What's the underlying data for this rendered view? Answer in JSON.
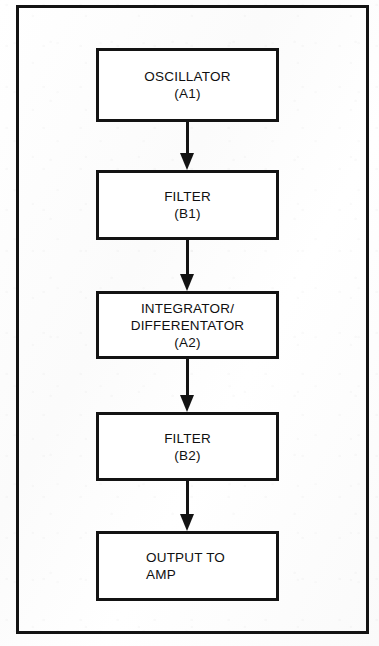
{
  "diagram": {
    "background_color": "#ffffff",
    "line_color": "#131313",
    "frame": {
      "x": 16,
      "y": 5,
      "width": 353,
      "height": 629,
      "stroke": 3
    },
    "blocks": [
      {
        "id": "oscillator",
        "name": "OSCILLATOR",
        "designator": "(A1)",
        "lines": [
          "OSCILLATOR",
          "(A1)"
        ],
        "x": 96,
        "y": 48,
        "width": 183,
        "height": 74,
        "text_align": "center"
      },
      {
        "id": "filter-b1",
        "name": "FILTER",
        "designator": "(B1)",
        "lines": [
          "FILTER",
          "(B1)"
        ],
        "x": 96,
        "y": 170,
        "width": 183,
        "height": 70,
        "text_align": "center"
      },
      {
        "id": "integrator-differentator",
        "name": "INTEGRATOR/ DIFFERENTATOR",
        "designator": "(A2)",
        "lines": [
          "INTEGRATOR/",
          "DIFFERENTATOR",
          "(A2)"
        ],
        "x": 96,
        "y": 291,
        "width": 183,
        "height": 68,
        "text_align": "center"
      },
      {
        "id": "filter-b2",
        "name": "FILTER",
        "designator": "(B2)",
        "lines": [
          "FILTER",
          "(B2)"
        ],
        "x": 96,
        "y": 412,
        "width": 183,
        "height": 69,
        "text_align": "center"
      },
      {
        "id": "output-to-amp",
        "name": "OUTPUT TO AMP",
        "designator": "",
        "lines": [
          "OUTPUT TO",
          "AMP"
        ],
        "x": 96,
        "y": 531,
        "width": 183,
        "height": 70,
        "text_align": "left"
      }
    ],
    "arrows": [
      {
        "id": "arrow-oscillator-to-filter-b1",
        "from": "oscillator",
        "to": "filter-b1",
        "x": 180,
        "y": 122,
        "length": 48,
        "direction": "down"
      },
      {
        "id": "arrow-filter-b1-to-integrator",
        "from": "filter-b1",
        "to": "integrator-differentator",
        "x": 180,
        "y": 240,
        "length": 51,
        "direction": "down"
      },
      {
        "id": "arrow-integrator-to-filter-b2",
        "from": "integrator-differentator",
        "to": "filter-b2",
        "x": 180,
        "y": 359,
        "length": 53,
        "direction": "down"
      },
      {
        "id": "arrow-filter-b2-to-output",
        "from": "filter-b2",
        "to": "output-to-amp",
        "x": 180,
        "y": 481,
        "length": 50,
        "direction": "down"
      }
    ]
  }
}
